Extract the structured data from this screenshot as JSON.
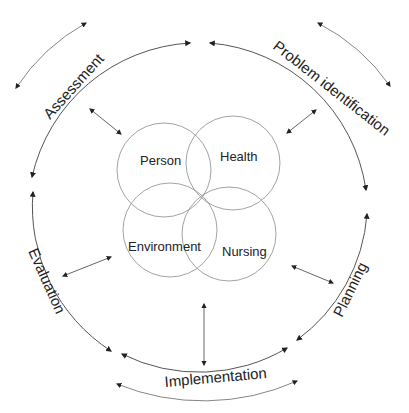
{
  "diagram": {
    "concepts": [
      {
        "id": "person",
        "label": "Person",
        "cx": 150,
        "cy": 172,
        "r": 48
      },
      {
        "id": "health",
        "label": "Health",
        "cx": 236,
        "cy": 165,
        "r": 48
      },
      {
        "id": "environment",
        "label": "Environment",
        "cx": 171,
        "cy": 243,
        "r": 48
      },
      {
        "id": "nursing",
        "label": "Nursing",
        "cx": 228,
        "cy": 248,
        "r": 48
      }
    ],
    "stages": [
      {
        "id": "assessment",
        "label": "Assessment"
      },
      {
        "id": "problem-identification",
        "label": "Problem identification"
      },
      {
        "id": "planning",
        "label": "Planning"
      },
      {
        "id": "implementation",
        "label": "Implementation"
      },
      {
        "id": "evaluation",
        "label": "Evaluation"
      }
    ],
    "colors": {
      "line": "#555555",
      "circle": "#999999",
      "text": "#222222",
      "background": "#ffffff"
    }
  }
}
